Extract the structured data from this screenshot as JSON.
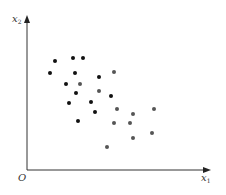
{
  "chart_data": {
    "type": "scatter",
    "title": "",
    "xlabel": "x",
    "xlabel_sub": "1",
    "ylabel": "x",
    "ylabel_sub": "2",
    "origin_label": "O",
    "xlim": [
      0,
      18.3
    ],
    "ylim": [
      0,
      15.4
    ],
    "grid": false,
    "legend": "none",
    "series": [
      {
        "name": "class-black",
        "color": "#111111",
        "points": [
          [
            2.3,
            9.7
          ],
          [
            2.8,
            10.9
          ],
          [
            4.6,
            11.2
          ],
          [
            5.6,
            11.2
          ],
          [
            4.8,
            9.7
          ],
          [
            3.9,
            8.6
          ],
          [
            4.9,
            7.7
          ],
          [
            4.2,
            6.7
          ],
          [
            6.4,
            6.8
          ],
          [
            6.8,
            5.8
          ],
          [
            5.1,
            4.9
          ],
          [
            7.2,
            9.3
          ],
          [
            8.4,
            7.4
          ]
        ]
      },
      {
        "name": "class-gray",
        "color": "#555555",
        "points": [
          [
            5.3,
            8.6
          ],
          [
            8.7,
            9.8
          ],
          [
            7.2,
            7.9
          ],
          [
            9.0,
            6.1
          ],
          [
            10.6,
            5.6
          ],
          [
            12.7,
            6.1
          ],
          [
            8.7,
            4.7
          ],
          [
            10.3,
            4.7
          ],
          [
            12.5,
            3.7
          ],
          [
            10.6,
            3.2
          ],
          [
            8.0,
            2.3
          ]
        ]
      }
    ]
  }
}
